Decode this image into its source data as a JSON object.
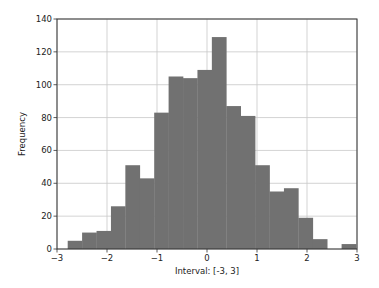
{
  "colors": {
    "bar": "#717171",
    "grid": "#c8c8c8",
    "axis": "#333333",
    "background": "#ffffff"
  },
  "chart_data": {
    "type": "bar",
    "subtype": "histogram",
    "title": "",
    "xlabel": "Interval: [-3, 3]",
    "ylabel": "Frequency",
    "xlim": [
      -3,
      3
    ],
    "ylim": [
      0,
      140
    ],
    "grid": true,
    "legend": null,
    "x_ticks": [
      -3,
      -2,
      -1,
      0,
      1,
      2,
      3
    ],
    "x_tick_labels": [
      "−3",
      "−2",
      "−1",
      "0",
      "1",
      "2",
      "3"
    ],
    "y_ticks": [
      0,
      20,
      40,
      60,
      80,
      100,
      120,
      140
    ],
    "y_tick_labels": [
      "0",
      "20",
      "40",
      "60",
      "80",
      "100",
      "120",
      "140"
    ],
    "bin_start": -2.786,
    "bin_width": 0.2883,
    "bin_edges": [
      -2.786,
      -2.498,
      -2.209,
      -1.921,
      -1.633,
      -1.344,
      -1.056,
      -0.768,
      -0.479,
      -0.191,
      0.097,
      0.386,
      0.674,
      0.962,
      1.251,
      1.539,
      1.827,
      2.116,
      2.404,
      2.692,
      2.98
    ],
    "values": [
      5,
      10,
      11,
      26,
      51,
      43,
      83,
      105,
      104,
      109,
      129,
      87,
      81,
      51,
      35,
      37,
      19,
      6,
      0,
      3
    ]
  }
}
